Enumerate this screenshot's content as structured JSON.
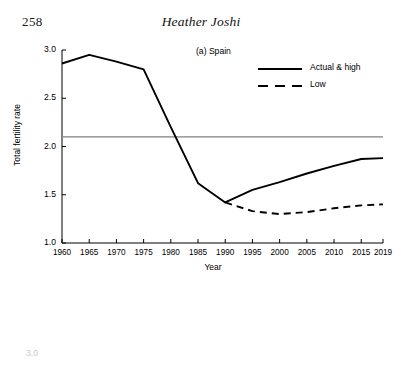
{
  "page": {
    "folio": "258",
    "running_head": "Heather Joshi"
  },
  "next_figure": {
    "partial_ytick": "3.0"
  },
  "chart_data": {
    "type": "line",
    "title": "(a) Spain",
    "xlabel": "Year",
    "ylabel": "Total fertility rate",
    "xlim": [
      1960,
      2019
    ],
    "ylim": [
      1.0,
      3.0
    ],
    "grid": false,
    "legend_position": "top-right",
    "x_tick_labels": [
      "1960",
      "1965",
      "1970",
      "1975",
      "1980",
      "1985",
      "1990",
      "1995",
      "2000",
      "2005",
      "2010",
      "2015",
      "2019"
    ],
    "x_ticks": [
      1960,
      1965,
      1970,
      1975,
      1980,
      1985,
      1990,
      1995,
      2000,
      2005,
      2010,
      2015,
      2019
    ],
    "y_tick_labels": [
      "1.0",
      "1.5",
      "2.0",
      "2.5",
      "3.0"
    ],
    "y_ticks": [
      1.0,
      1.5,
      2.0,
      2.5,
      3.0
    ],
    "reference_line": {
      "label": "replacement level",
      "value": 2.1,
      "color": "#808080"
    },
    "series": [
      {
        "name": "Actual & high",
        "style": "solid",
        "color": "#000000",
        "x": [
          1960,
          1965,
          1970,
          1975,
          1980,
          1985,
          1990,
          1995,
          2000,
          2005,
          2010,
          2015,
          2019
        ],
        "values": [
          2.86,
          2.95,
          2.88,
          2.8,
          2.2,
          1.62,
          1.42,
          1.55,
          1.63,
          1.72,
          1.8,
          1.87,
          1.88
        ]
      },
      {
        "name": "Low",
        "style": "dashed",
        "color": "#000000",
        "x": [
          1990,
          1995,
          2000,
          2005,
          2010,
          2015,
          2019
        ],
        "values": [
          1.42,
          1.33,
          1.3,
          1.32,
          1.36,
          1.39,
          1.4
        ]
      }
    ]
  }
}
